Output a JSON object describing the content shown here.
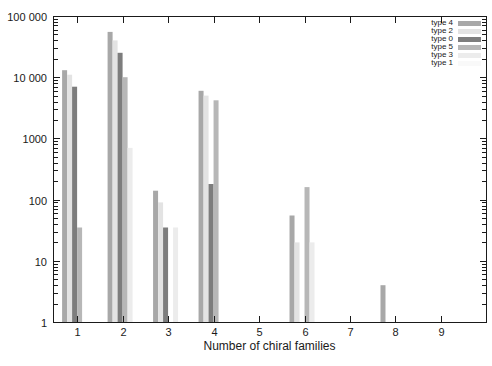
{
  "chart_data": {
    "type": "bar",
    "title": "",
    "xlabel": "Number of chiral families",
    "ylabel": "",
    "y_scale": "log",
    "ylim": [
      1,
      100000
    ],
    "xlim": [
      0.47,
      9.99
    ],
    "grid": false,
    "legend_position": "top-right-inside",
    "y_tick_labels": [
      "1",
      "10",
      "100",
      "1000",
      "10 000",
      "100 000"
    ],
    "x_ticks": [
      1,
      2,
      3,
      4,
      5,
      6,
      7,
      8,
      9
    ],
    "categories": [
      1,
      2,
      3,
      4,
      5,
      6,
      7,
      8,
      9
    ],
    "series": [
      {
        "name": "type 4",
        "color": "#a8a8a8",
        "values": [
          13000,
          55000,
          140,
          6000,
          null,
          55,
          null,
          4,
          null
        ]
      },
      {
        "name": "type 2",
        "color": "#e3e3e3",
        "values": [
          11000,
          40000,
          90,
          5000,
          null,
          20,
          null,
          null,
          null
        ]
      },
      {
        "name": "type 0",
        "color": "#7d7d7d",
        "values": [
          7000,
          25000,
          35,
          180,
          null,
          null,
          null,
          null,
          null
        ]
      },
      {
        "name": "type 5",
        "color": "#b7b7b7",
        "values": [
          35,
          10000,
          null,
          4200,
          null,
          160,
          null,
          null,
          null
        ]
      },
      {
        "name": "type 3",
        "color": "#ececec",
        "values": [
          null,
          700,
          35,
          null,
          null,
          20,
          null,
          null,
          null
        ]
      },
      {
        "name": "type 1",
        "color": "#f9f9f9",
        "values": [
          null,
          null,
          null,
          null,
          null,
          null,
          null,
          null,
          null
        ]
      }
    ],
    "ink_color": "#1a1a1a"
  }
}
